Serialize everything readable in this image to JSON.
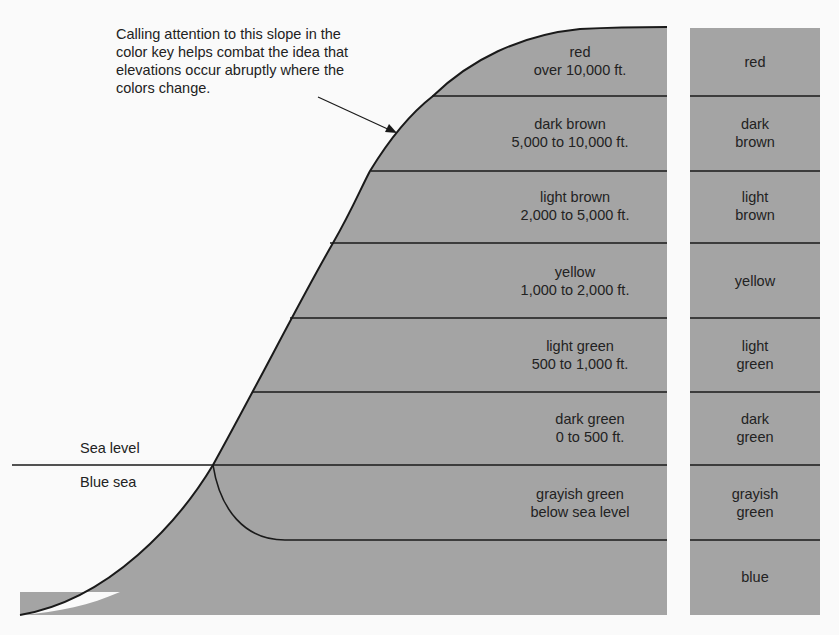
{
  "annotation": {
    "lines": [
      "Calling attention to this slope in the",
      "color key helps combat the idea that",
      "elevations occur abruptly where the",
      "colors change."
    ]
  },
  "sea_level_label": "Sea level",
  "blue_sea_label": "Blue sea",
  "bands": [
    {
      "color": "red",
      "range": "over 10,000 ft.",
      "key": [
        "red"
      ]
    },
    {
      "color": "dark brown",
      "range": "5,000 to 10,000 ft.",
      "key": [
        "dark",
        "brown"
      ]
    },
    {
      "color": "light brown",
      "range": "2,000 to 5,000 ft.",
      "key": [
        "light",
        "brown"
      ]
    },
    {
      "color": "yellow",
      "range": "1,000 to 2,000 ft.",
      "key": [
        "yellow"
      ]
    },
    {
      "color": "light green",
      "range": "500 to 1,000 ft.",
      "key": [
        "light",
        "green"
      ]
    },
    {
      "color": "dark green",
      "range": "0 to 500 ft.",
      "key": [
        "dark",
        "green"
      ]
    },
    {
      "color": "grayish green",
      "range": "below sea level",
      "key": [
        "grayish",
        "green"
      ]
    },
    {
      "color": "blue",
      "range": "",
      "key": [
        "blue"
      ]
    }
  ],
  "colors": {
    "fill": "#a4a4a4",
    "line": "#1a1a1a",
    "background": "#fafafa"
  }
}
